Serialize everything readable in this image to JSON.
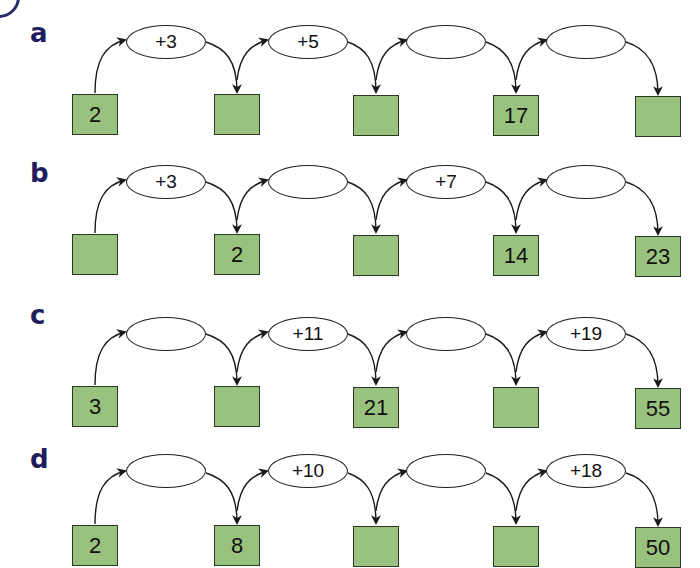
{
  "problems": [
    {
      "label": "a",
      "boxes": [
        "2",
        "",
        "",
        "17",
        ""
      ],
      "operators": [
        "+3",
        "+5",
        "",
        ""
      ]
    },
    {
      "label": "b",
      "boxes": [
        "",
        "2",
        "",
        "14",
        "23"
      ],
      "operators": [
        "+3",
        "",
        "+7",
        ""
      ]
    },
    {
      "label": "c",
      "boxes": [
        "3",
        "",
        "21",
        "",
        "55"
      ],
      "operators": [
        "",
        "+11",
        "",
        "+19"
      ]
    },
    {
      "label": "d",
      "boxes": [
        "2",
        "8",
        "",
        "",
        "50"
      ],
      "operators": [
        "",
        "+10",
        "",
        "+18"
      ]
    }
  ],
  "colors": {
    "box_fill": "#9ac27f",
    "label": "#1f1d5c",
    "line": "#1a1a1a"
  }
}
